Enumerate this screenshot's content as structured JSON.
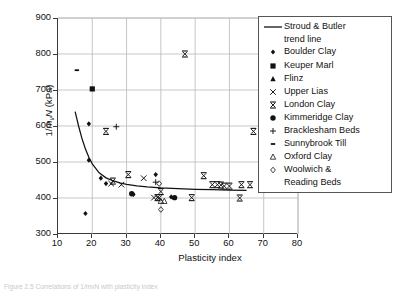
{
  "chart_data": {
    "type": "scatter",
    "title": "",
    "xlabel": "Plasticity index",
    "ylabel": "1/mvN (kPa)",
    "ylabel_parts": {
      "pre": "1/",
      "italic_m": "m",
      "sub": "v",
      "italic_n": "N",
      "unit": " (kPa)"
    },
    "xlim": [
      10,
      80
    ],
    "ylim": [
      300,
      900
    ],
    "xticks": [
      10,
      20,
      30,
      40,
      50,
      60,
      70,
      80
    ],
    "yticks": [
      300,
      400,
      500,
      600,
      700,
      800,
      900
    ],
    "grid": "both",
    "legend_position": "top-right-inside",
    "series": [
      {
        "name": "Stroud & Butler trend line",
        "marker": "line",
        "type": "line",
        "points": [
          [
            15.0,
            640
          ],
          [
            16.0,
            600
          ],
          [
            17.0,
            565
          ],
          [
            18.0,
            536
          ],
          [
            19.0,
            513
          ],
          [
            20.0,
            495
          ],
          [
            22.0,
            470
          ],
          [
            24.0,
            456
          ],
          [
            26.0,
            448
          ],
          [
            28.0,
            442
          ],
          [
            30.0,
            438
          ],
          [
            33.0,
            434
          ],
          [
            36.0,
            431
          ],
          [
            40.0,
            428
          ],
          [
            45.0,
            426
          ],
          [
            50.0,
            424
          ],
          [
            55.0,
            423
          ],
          [
            60.0,
            422
          ],
          [
            65.0,
            421
          ]
        ]
      },
      {
        "name": "Boulder Clay",
        "marker": "diamond",
        "points": [
          [
            18.0,
            357
          ],
          [
            19.0,
            606
          ],
          [
            19.0,
            505
          ],
          [
            22.5,
            455
          ],
          [
            24.0,
            440
          ],
          [
            32.0,
            410
          ],
          [
            38.5,
            465
          ],
          [
            43.0,
            403
          ]
        ]
      },
      {
        "name": "Keuper Marl",
        "marker": "square",
        "points": [
          [
            20.0,
            703
          ]
        ]
      },
      {
        "name": "Flinz",
        "marker": "triangle-up-filled",
        "points": []
      },
      {
        "name": "Upper Lias",
        "marker": "cross-x",
        "points": [
          [
            25.5,
            440
          ],
          [
            28.5,
            437
          ],
          [
            35.0,
            455
          ],
          [
            38.0,
            401
          ],
          [
            39.5,
            400
          ]
        ]
      },
      {
        "name": "London Clay",
        "marker": "bar-x",
        "points": [
          [
            24.0,
            585
          ],
          [
            30.5,
            465
          ],
          [
            26.0,
            447
          ],
          [
            39.0,
            401
          ],
          [
            40.0,
            418
          ],
          [
            47.0,
            800
          ],
          [
            52.5,
            462
          ],
          [
            49.0,
            401
          ],
          [
            55.0,
            437
          ],
          [
            56.5,
            437
          ],
          [
            57.5,
            436
          ],
          [
            58.5,
            433
          ],
          [
            60.0,
            433
          ],
          [
            63.5,
            437
          ],
          [
            66.0,
            437
          ],
          [
            63.0,
            400
          ],
          [
            67.0,
            585
          ]
        ]
      },
      {
        "name": "Kimmeridge Clay",
        "marker": "circle-filled",
        "points": [
          [
            31.5,
            412
          ],
          [
            44.0,
            401
          ]
        ]
      },
      {
        "name": "Bracklesham Beds",
        "marker": "plus",
        "points": [
          [
            27.0,
            598
          ],
          [
            38.5,
            444
          ]
        ]
      },
      {
        "name": "Sunnybrook Till",
        "marker": "dash",
        "points": [
          [
            15.5,
            755
          ]
        ]
      },
      {
        "name": "Oxford Clay",
        "marker": "triangle-up-open",
        "points": [
          [
            40.0,
            391
          ],
          [
            41.0,
            391
          ]
        ]
      },
      {
        "name": "Woolwich & Reading Beds",
        "marker": "diamond-open",
        "points": [
          [
            39.5,
            440
          ],
          [
            40.0,
            368
          ]
        ]
      }
    ]
  },
  "axes": {
    "y_tick_labels": [
      "900",
      "800",
      "700",
      "600",
      "500",
      "400",
      "300"
    ],
    "x_tick_labels": [
      "10",
      "20",
      "30",
      "40",
      "50",
      "60",
      "70",
      "80"
    ],
    "x_title": "Plasticity index"
  },
  "legend": {
    "items": [
      {
        "label": "Stroud & Butler",
        "label2": "trend line",
        "marker": "line"
      },
      {
        "label": "Boulder Clay",
        "marker": "diamond"
      },
      {
        "label": "Keuper Marl",
        "marker": "square"
      },
      {
        "label": "Flinz",
        "marker": "triangle-up-filled"
      },
      {
        "label": "Upper Lias",
        "marker": "cross-x"
      },
      {
        "label": "London Clay",
        "marker": "bar-x"
      },
      {
        "label": "Kimmeridge Clay",
        "marker": "circle-filled"
      },
      {
        "label": "Bracklesham Beds",
        "marker": "plus"
      },
      {
        "label": "Sunnybrook Till",
        "marker": "dash"
      },
      {
        "label": "Oxford Clay",
        "marker": "triangle-up-open"
      },
      {
        "label": "Woolwich &",
        "label2": "Reading Beds",
        "marker": "diamond-open"
      }
    ]
  },
  "caption": {
    "text": "Figure 2.5   Correlations of 1/mvN with plasticity index"
  },
  "colors": {
    "axis": "#3a3a3a",
    "grid": "#b8b8b8",
    "marker": "#111111",
    "legend_border": "#555555"
  }
}
